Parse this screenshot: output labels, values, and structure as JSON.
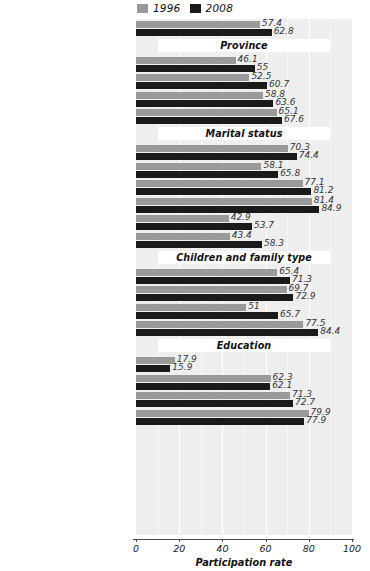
{
  "chart_data": {
    "type": "bar",
    "orientation": "horizontal",
    "title": "",
    "xlabel": "Participation rate",
    "ylabel": "",
    "xlim": [
      0,
      100
    ],
    "xticks": [
      0,
      20,
      40,
      60,
      80,
      100
    ],
    "grid": true,
    "legend_position": "top-center",
    "series": [
      {
        "name": "1996",
        "color": "#9a9a9a"
      },
      {
        "name": "2008",
        "color": "#1a1a1a"
      }
    ],
    "groups": [
      {
        "header": "",
        "rows": [
          {
            "category": "All women 15 years and over",
            "values": [
              57.4,
              62.8
            ]
          }
        ]
      },
      {
        "header": "Province",
        "rows": [
          {
            "category": "Newfoundland and Labrador",
            "values": [
              46.1,
              55
            ]
          },
          {
            "category": "New Brunswick",
            "values": [
              52.5,
              60.7
            ]
          },
          {
            "category": "Ontario",
            "values": [
              58.8,
              63.6
            ]
          },
          {
            "category": "Alberta",
            "values": [
              65.1,
              67.6
            ]
          }
        ]
      },
      {
        "header": "Marital status",
        "rows": [
          {
            "category": "Married, aged 15–24",
            "values": [
              70.3,
              74.4
            ]
          },
          {
            "category": "Single, aged 15–24",
            "values": [
              58.1,
              65.8
            ]
          },
          {
            "category": "Married, aged 25–44",
            "values": [
              77.1,
              81.2
            ]
          },
          {
            "category": "Single, aged 25–44",
            "values": [
              81.4,
              84.9
            ]
          },
          {
            "category": "Married, aged 45 and over",
            "values": [
              42.9,
              53.7
            ]
          },
          {
            "category": "Single, aged 45 and over",
            "values": [
              43.4,
              58.3
            ]
          }
        ]
      },
      {
        "header": "Children and family type",
        "rows": [
          {
            "category": "Preschooler(s)",
            "values": [
              65.4,
              71.3
            ]
          },
          {
            "category": "Preschooler(s)/employed husband",
            "values": [
              69.7,
              72.9
            ]
          },
          {
            "category": "Preschooler(s)/lone parent",
            "values": [
              51,
              65.7
            ]
          },
          {
            "category": "Children 6–15",
            "values": [
              77.5,
              84.4
            ]
          }
        ]
      },
      {
        "header": "Education",
        "rows": [
          {
            "category": "0–8 years’ education",
            "values": [
              17.9,
              15.9
            ]
          },
          {
            "category": "High-school diploma",
            "values": [
              62.3,
              62.1
            ]
          },
          {
            "category": "College diploma/certificate",
            "values": [
              71.3,
              72.7
            ]
          },
          {
            "category": "University degree",
            "values": [
              79.9,
              77.9
            ]
          }
        ]
      }
    ]
  },
  "legend": {
    "entries": [
      {
        "label": "1996",
        "color": "#9a9a9a"
      },
      {
        "label": "2008",
        "color": "#1a1a1a"
      }
    ]
  },
  "axis": {
    "title": "Participation rate",
    "ticks": [
      "0",
      "20",
      "40",
      "60",
      "80",
      "100"
    ]
  }
}
